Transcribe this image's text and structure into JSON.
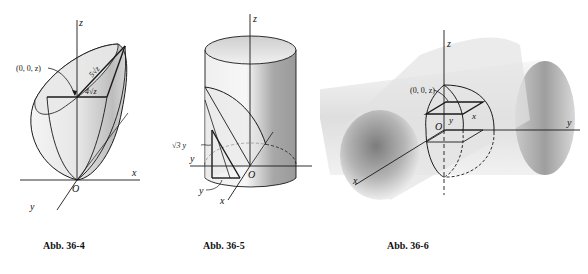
{
  "figures": [
    {
      "id": "fig-36-4",
      "caption": "Abb. 36-4",
      "labels": {
        "z_axis": "z",
        "x_axis": "x",
        "y_axis": "y",
        "origin": "O",
        "point": "(0, 0, z)",
        "long_segment": "5√z",
        "short_segment": "4√z"
      }
    },
    {
      "id": "fig-36-5",
      "caption": "Abb. 36-5",
      "labels": {
        "z_axis": "z",
        "x_axis": "x",
        "y_axis": "y",
        "origin": "O",
        "height_label": "√3 y",
        "base_label": "y"
      }
    },
    {
      "id": "fig-36-6",
      "caption": "Abb. 36-6",
      "labels": {
        "z_axis": "z",
        "x_axis": "x",
        "y_axis": "y",
        "origin": "O",
        "point": "(0, 0, z)",
        "square_x": "x",
        "square_y": "y"
      }
    }
  ],
  "colors": {
    "line": "#1a1a1a",
    "shade_light": "#f2f2f2",
    "shade_dark": "#8a8a8a",
    "background": "#ffffff"
  }
}
